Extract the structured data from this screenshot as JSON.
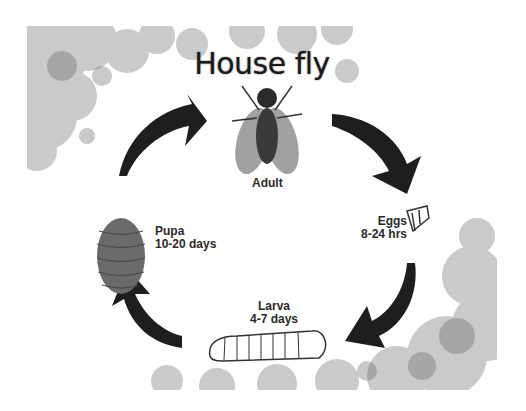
{
  "title": "House fly",
  "stages": [
    {
      "name": "Adult",
      "duration": ""
    },
    {
      "name": "Eggs",
      "duration": "8-24 hrs"
    },
    {
      "name": "Larva",
      "duration": "4-7 days"
    },
    {
      "name": "Pupa",
      "duration": "10-20 days"
    }
  ],
  "icons": [
    "fly-adult-icon",
    "eggs-icon",
    "larva-icon",
    "pupa-icon",
    "cycle-arrow-icon"
  ],
  "colors": {
    "arrow": "#1e1e1e",
    "bubble": "#9a9a9a",
    "text": "#2a2a2a"
  }
}
